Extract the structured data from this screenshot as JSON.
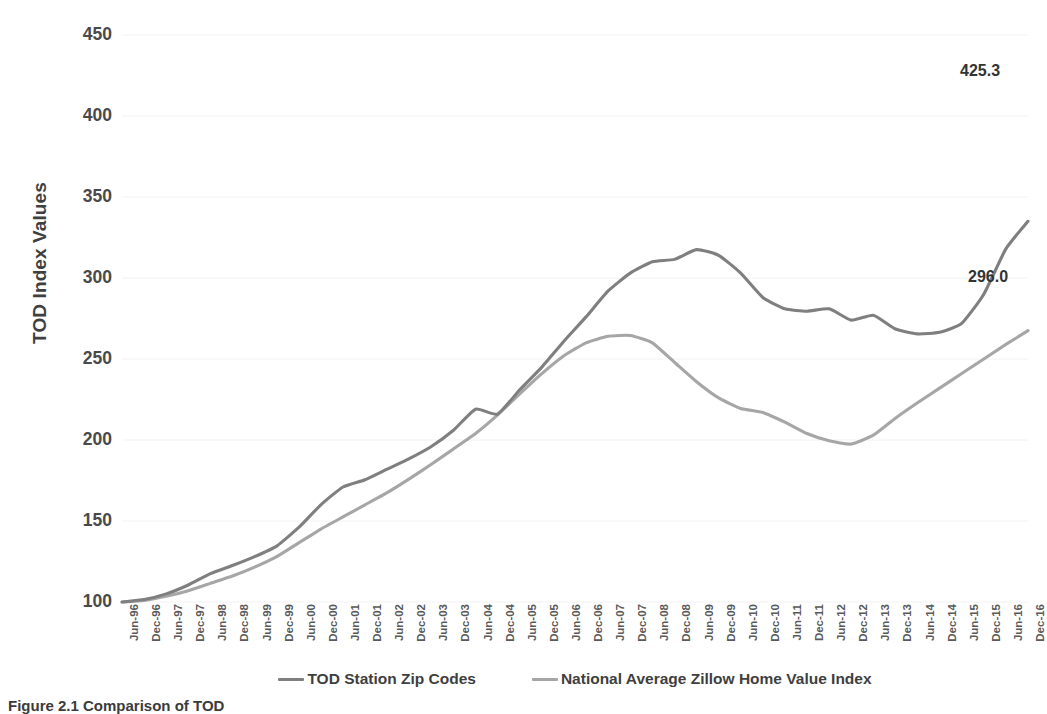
{
  "chart_data": {
    "type": "line",
    "title": "",
    "xlabel": "",
    "ylabel": "TOD Index Values",
    "ylim": [
      100,
      450
    ],
    "ytick_step": 50,
    "yticks": [
      450,
      400,
      350,
      300,
      250,
      200,
      150,
      100
    ],
    "grid": "horizontal",
    "legend_position": "bottom",
    "x": [
      "Jun-96",
      "Dec-96",
      "Jun-97",
      "Dec-97",
      "Jun-98",
      "Dec-98",
      "Jun-99",
      "Dec-99",
      "Jun-00",
      "Dec-00",
      "Jun-01",
      "Dec-01",
      "Jun-02",
      "Dec-02",
      "Jun-03",
      "Dec-03",
      "Jun-04",
      "Dec-04",
      "Jun-05",
      "Dec-05",
      "Jun-06",
      "Dec-06",
      "Jun-07",
      "Dec-07",
      "Jun-08",
      "Dec-08",
      "Jun-09",
      "Dec-09",
      "Jun-10",
      "Dec-10",
      "Jun-11",
      "Dec-11",
      "Jun-12",
      "Dec-12",
      "Jun-13",
      "Dec-13",
      "Jun-14",
      "Dec-14",
      "Jun-15",
      "Dec-15",
      "Jun-16",
      "Dec-16"
    ],
    "series": [
      {
        "name": "TOD Station Zip Codes",
        "color": "#7f7f7f",
        "end_label": "425.3",
        "values": [
          100.0,
          101.5,
          105.0,
          110.5,
          117.5,
          122.5,
          128.0,
          134.5,
          146.0,
          160.0,
          171.0,
          175.5,
          182.0,
          188.5,
          196.0,
          206.0,
          219.0,
          216.0,
          231.0,
          245.0,
          261.0,
          276.0,
          292.0,
          303.0,
          310.0,
          311.5,
          317.5,
          314.0,
          303.0,
          288.0,
          281.0,
          279.5,
          281.0,
          274.0,
          277.0,
          268.5,
          265.5,
          266.5,
          272.0,
          290.0,
          318.0,
          335.0
        ],
        "values_note": "semiannual index, Jun-96 = 100"
      },
      {
        "name": "National Average Zillow Home Value Index",
        "color": "#a6a6a6",
        "end_label": "296.0",
        "values": [
          100.0,
          101.0,
          103.5,
          107.0,
          111.5,
          116.0,
          121.5,
          128.0,
          136.5,
          145.0,
          152.5,
          160.0,
          167.5,
          176.0,
          185.0,
          194.5,
          204.0,
          215.5,
          228.5,
          241.0,
          252.0,
          260.0,
          264.0,
          264.5,
          260.0,
          248.0,
          236.0,
          226.0,
          219.5,
          217.0,
          211.0,
          204.0,
          199.5,
          197.5,
          203.0,
          213.5,
          223.0,
          232.0,
          241.0,
          250.0,
          259.0,
          267.5
        ]
      }
    ],
    "annotations": [
      {
        "text": "425.3",
        "series": "TOD Station Zip Codes",
        "at": "Dec-16"
      },
      {
        "text": "296.0",
        "series": "National Average Zillow Home Value Index",
        "at": "Dec-16"
      }
    ]
  },
  "axis": {
    "y_title": "TOD Index Values",
    "y_ticks": [
      "450",
      "400",
      "350",
      "300",
      "250",
      "200",
      "150",
      "100"
    ],
    "x_ticks": [
      "Jun-96",
      "Dec-96",
      "Jun-97",
      "Dec-97",
      "Jun-98",
      "Dec-98",
      "Jun-99",
      "Dec-99",
      "Jun-00",
      "Dec-00",
      "Jun-01",
      "Dec-01",
      "Jun-02",
      "Dec-02",
      "Jun-03",
      "Dec-03",
      "Jun-04",
      "Dec-04",
      "Jun-05",
      "Dec-05",
      "Jun-06",
      "Dec-06",
      "Jun-07",
      "Dec-07",
      "Jun-08",
      "Dec-08",
      "Jun-09",
      "Dec-09",
      "Jun-10",
      "Dec-10",
      "Jun-11",
      "Dec-11",
      "Jun-12",
      "Dec-12",
      "Jun-13",
      "Dec-13",
      "Jun-14",
      "Dec-14",
      "Jun-15",
      "Dec-15",
      "Jun-16",
      "Dec-16"
    ]
  },
  "labels": {
    "tod_end": "425.3",
    "national_end": "296.0"
  },
  "legend": {
    "items": [
      {
        "label": "TOD Station Zip Codes",
        "color": "#7f7f7f"
      },
      {
        "label": "National Average Zillow Home Value Index",
        "color": "#a6a6a6"
      }
    ]
  },
  "caption": {
    "text": "Figure 2.1  Comparison of TOD"
  },
  "colors": {
    "tod_line": "#7f7f7f",
    "national_line": "#a6a6a6",
    "gridline": "#f2f2f2",
    "text": "#404040"
  }
}
